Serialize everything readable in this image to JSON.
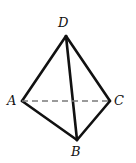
{
  "figure": {
    "name": "tetrahedron-abcd",
    "width": 136,
    "height": 163,
    "background_color": "#ffffff",
    "stroke_color": "#111111",
    "solid_stroke_width": 2.6,
    "dashed_stroke_color": "#7a7a7a",
    "dashed_stroke_width": 1.4,
    "dash_pattern": "6,4",
    "vertices": [
      {
        "id": "A",
        "label": "A",
        "x": 22,
        "y": 101,
        "label_x": 7,
        "label_y": 94
      },
      {
        "id": "B",
        "label": "B",
        "x": 77,
        "y": 140,
        "label_x": 71,
        "label_y": 145
      },
      {
        "id": "C",
        "label": "C",
        "x": 110,
        "y": 101,
        "label_x": 114,
        "label_y": 94
      },
      {
        "id": "D",
        "label": "D",
        "x": 66,
        "y": 36,
        "label_x": 58,
        "label_y": 16
      }
    ],
    "edges": [
      {
        "id": "AD",
        "from": "A",
        "to": "D",
        "style": "solid",
        "hidden": false
      },
      {
        "id": "DC",
        "from": "D",
        "to": "C",
        "style": "solid",
        "hidden": false
      },
      {
        "id": "AB",
        "from": "A",
        "to": "B",
        "style": "solid",
        "hidden": false
      },
      {
        "id": "BC",
        "from": "B",
        "to": "C",
        "style": "solid",
        "hidden": false
      },
      {
        "id": "DB",
        "from": "D",
        "to": "B",
        "style": "solid",
        "hidden": false
      },
      {
        "id": "AC",
        "from": "A",
        "to": "C",
        "style": "dashed",
        "hidden": true
      }
    ]
  }
}
